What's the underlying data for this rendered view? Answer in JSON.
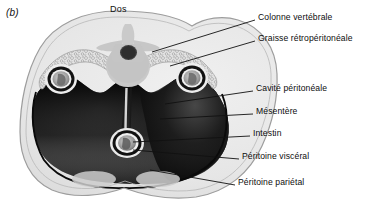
{
  "figure": {
    "panel_label": "(b)",
    "orientation_label": "Dos",
    "caption_type": "anatomical-cross-section"
  },
  "colors": {
    "background": "#ffffff",
    "body_fill": "#e8e8e8",
    "body_outline": "#9a9a9a",
    "peritoneal_cavity_dark": "#0b0b0b",
    "retroperitoneal_fat": "#d8d8d8",
    "vertebra_fill": "#c9c9c9",
    "spinal_canal": "#3a3a3a",
    "kidney_ring": "#1a1a1a",
    "kidney_interior": "#b5b5b5",
    "muscle_oval": "#cfcfcf",
    "leader_line": "#111111",
    "text": "#0d0d0d"
  },
  "labels": [
    {
      "id": "colonne-vertebrale",
      "text": "Colonne vertébrale",
      "x": 258,
      "y": 17,
      "line": {
        "x1": 152,
        "y1": 52,
        "x2": 255,
        "y2": 20
      }
    },
    {
      "id": "graisse-retroperitoneale",
      "text": "Graisse rétropéritonéale",
      "x": 258,
      "y": 38,
      "line": {
        "x1": 170,
        "y1": 66,
        "x2": 255,
        "y2": 41
      }
    },
    {
      "id": "cavite-peritoneale",
      "text": "Cavité péritonéale",
      "x": 256,
      "y": 88,
      "line": {
        "x1": 165,
        "y1": 104,
        "x2": 253,
        "y2": 91
      }
    },
    {
      "id": "mesentere",
      "text": "Mésentère",
      "x": 256,
      "y": 111,
      "line": {
        "x1": 160,
        "y1": 119,
        "x2": 253,
        "y2": 114
      }
    },
    {
      "id": "intestin",
      "text": "Intestin",
      "x": 253,
      "y": 133,
      "line": {
        "x1": 133,
        "y1": 142,
        "x2": 250,
        "y2": 136
      }
    },
    {
      "id": "peritoine-visceral",
      "text": "Péritoine viscéral",
      "x": 242,
      "y": 156,
      "line": {
        "x1": 133,
        "y1": 150,
        "x2": 239,
        "y2": 159
      }
    },
    {
      "id": "peritoine-parietal",
      "text": "Péritoine pariétal",
      "x": 238,
      "y": 182,
      "line": {
        "x1": 150,
        "y1": 170,
        "x2": 235,
        "y2": 185
      }
    }
  ],
  "structures": [
    {
      "id": "vertebra",
      "name": "Colonne vertébrale"
    },
    {
      "id": "retroperitoneal-fat",
      "name": "Graisse rétropéritonéale"
    },
    {
      "id": "peritoneal-cavity",
      "name": "Cavité péritonéale"
    },
    {
      "id": "mesentery",
      "name": "Mésentère"
    },
    {
      "id": "intestine",
      "name": "Intestin"
    },
    {
      "id": "kidney-left",
      "name": "Rein gauche"
    },
    {
      "id": "kidney-right",
      "name": "Rein droit"
    },
    {
      "id": "visceral-peritoneum",
      "name": "Péritoine viscéral"
    },
    {
      "id": "parietal-peritoneum",
      "name": "Péritoine pariétal"
    }
  ]
}
